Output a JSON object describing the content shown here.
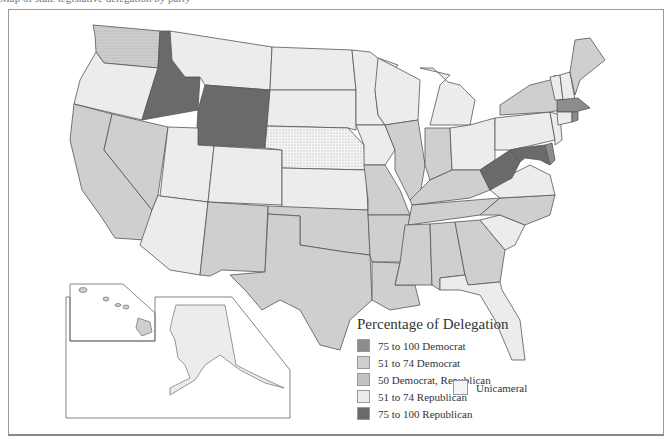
{
  "caption": "Map of state legislative delegation by party",
  "legend": {
    "title": "Percentage of Delegation",
    "items": [
      {
        "label": "75  to 100  Democrat",
        "color": "#8c8c8c"
      },
      {
        "label": "51  to 74  Democrat",
        "color": "#cfcfcf"
      },
      {
        "label": "50  Democrat, Republican",
        "color": "#c2c2c2"
      },
      {
        "label": "51  to 74  Republican",
        "color": "#ececec"
      },
      {
        "label": "75  to 100  Republican",
        "color": "#6a6a6a"
      }
    ],
    "unicameral": {
      "label": "Unicameral",
      "color": "#f4f4f4"
    }
  },
  "colors": {
    "dem_strong": "#8c8c8c",
    "dem": "#cfcfcf",
    "split": "#c2c2c2",
    "rep": "#ececec",
    "rep_strong": "#6a6a6a",
    "unicameral": "#f4f4f4",
    "border": "#555555"
  },
  "insets": {
    "alaska": "Alaska",
    "hawaii": "Hawaii"
  }
}
